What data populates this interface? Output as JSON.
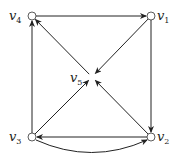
{
  "diagram": {
    "type": "directed-graph",
    "nodes": [
      {
        "id": "v1",
        "label": "v",
        "sub": "1",
        "x": 151,
        "y": 16
      },
      {
        "id": "v2",
        "label": "v",
        "sub": "2",
        "x": 151,
        "y": 137
      },
      {
        "id": "v3",
        "label": "v",
        "sub": "3",
        "x": 32,
        "y": 137
      },
      {
        "id": "v4",
        "label": "v",
        "sub": "4",
        "x": 32,
        "y": 16
      },
      {
        "id": "v5",
        "label": "v",
        "sub": "5",
        "x": 92,
        "y": 77
      }
    ],
    "edges": [
      {
        "from": "v4",
        "to": "v1",
        "style": "straight"
      },
      {
        "from": "v1",
        "to": "v2",
        "style": "straight"
      },
      {
        "from": "v1",
        "to": "v5",
        "style": "straight"
      },
      {
        "from": "v5",
        "to": "v4",
        "style": "straight"
      },
      {
        "from": "v3",
        "to": "v4",
        "style": "straight"
      },
      {
        "from": "v3",
        "to": "v5",
        "style": "straight"
      },
      {
        "from": "v2",
        "to": "v5",
        "style": "straight"
      },
      {
        "from": "v2",
        "to": "v3",
        "style": "straight"
      },
      {
        "from": "v3",
        "to": "v2",
        "style": "curved"
      }
    ],
    "colors": {
      "edge": "#222222",
      "node_fill": "#ffffff",
      "node_stroke": "#333333"
    }
  }
}
